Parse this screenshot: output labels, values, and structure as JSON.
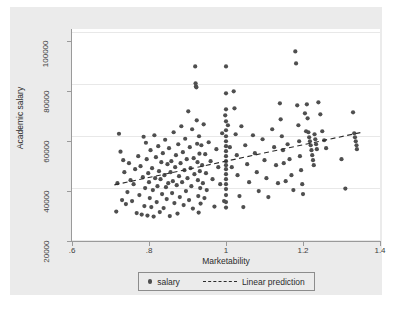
{
  "figure": {
    "background_color": "#ebebeb",
    "plot_background_color": "#ffffff",
    "marker_color": "#4f4f4f",
    "axis_color": "#9a9a9a",
    "grid_color": "#e8e8e8"
  },
  "legend": {
    "salary_label": "salary",
    "linear_prediction_label": "Linear prediction"
  },
  "chart_data": {
    "type": "scatter",
    "title": "",
    "xlabel": "Marketability",
    "ylabel": "Academic salary",
    "xlim": [
      0.6,
      1.4
    ],
    "ylim": [
      20000,
      105000
    ],
    "xticks": [
      0.6,
      0.8,
      1,
      1.2,
      1.4
    ],
    "xtick_labels": [
      ".6",
      ".8",
      "1",
      "1.2",
      "1.4"
    ],
    "yticks": [
      20000,
      40000,
      60000,
      80000,
      100000
    ],
    "ytick_labels": [
      "20000",
      "40000",
      "60000",
      "80000",
      "100000"
    ],
    "grid": "horizontal",
    "legend_position": "below-axis-centered",
    "series": [
      {
        "name": "salary",
        "type": "scatter",
        "marker": "circle",
        "color": "#4f4f4f",
        "points": [
          [
            0.715,
            31800
          ],
          [
            0.718,
            43200
          ],
          [
            0.722,
            63000
          ],
          [
            0.726,
            55800
          ],
          [
            0.73,
            36400
          ],
          [
            0.733,
            52400
          ],
          [
            0.736,
            47600
          ],
          [
            0.74,
            34800
          ],
          [
            0.744,
            39600
          ],
          [
            0.748,
            51200
          ],
          [
            0.752,
            44400
          ],
          [
            0.756,
            36000
          ],
          [
            0.76,
            42800
          ],
          [
            0.764,
            48800
          ],
          [
            0.768,
            31200
          ],
          [
            0.772,
            54000
          ],
          [
            0.775,
            38400
          ],
          [
            0.778,
            50000
          ],
          [
            0.781,
            30600
          ],
          [
            0.784,
            45600
          ],
          [
            0.786,
            61800
          ],
          [
            0.788,
            34000
          ],
          [
            0.79,
            41200
          ],
          [
            0.792,
            59400
          ],
          [
            0.794,
            52800
          ],
          [
            0.796,
            30200
          ],
          [
            0.798,
            47200
          ],
          [
            0.8,
            43600
          ],
          [
            0.802,
            37200
          ],
          [
            0.804,
            56400
          ],
          [
            0.806,
            33600
          ],
          [
            0.808,
            49200
          ],
          [
            0.81,
            40400
          ],
          [
            0.812,
            29800
          ],
          [
            0.814,
            62400
          ],
          [
            0.816,
            45200
          ],
          [
            0.818,
            53600
          ],
          [
            0.82,
            35600
          ],
          [
            0.822,
            42000
          ],
          [
            0.824,
            58000
          ],
          [
            0.826,
            48000
          ],
          [
            0.828,
            31600
          ],
          [
            0.83,
            44800
          ],
          [
            0.832,
            51600
          ],
          [
            0.834,
            38800
          ],
          [
            0.836,
            55200
          ],
          [
            0.838,
            33200
          ],
          [
            0.84,
            46400
          ],
          [
            0.842,
            60600
          ],
          [
            0.844,
            41600
          ],
          [
            0.846,
            36800
          ],
          [
            0.848,
            50800
          ],
          [
            0.85,
            43200
          ],
          [
            0.852,
            57200
          ],
          [
            0.854,
            30000
          ],
          [
            0.856,
            47600
          ],
          [
            0.858,
            52000
          ],
          [
            0.86,
            39200
          ],
          [
            0.862,
            44000
          ],
          [
            0.864,
            63600
          ],
          [
            0.866,
            35200
          ],
          [
            0.868,
            49600
          ],
          [
            0.87,
            54400
          ],
          [
            0.872,
            42400
          ],
          [
            0.874,
            31000
          ],
          [
            0.876,
            58800
          ],
          [
            0.878,
            46000
          ],
          [
            0.88,
            37600
          ],
          [
            0.882,
            51200
          ],
          [
            0.884,
            66000
          ],
          [
            0.886,
            43600
          ],
          [
            0.888,
            55600
          ],
          [
            0.89,
            34400
          ],
          [
            0.892,
            48400
          ],
          [
            0.894,
            61000
          ],
          [
            0.896,
            40000
          ],
          [
            0.898,
            52800
          ],
          [
            0.9,
            45200
          ],
          [
            0.902,
            72000
          ],
          [
            0.904,
            36400
          ],
          [
            0.906,
            57600
          ],
          [
            0.908,
            49200
          ],
          [
            0.91,
            42000
          ],
          [
            0.912,
            64800
          ],
          [
            0.914,
            33000
          ],
          [
            0.916,
            53200
          ],
          [
            0.918,
            46800
          ],
          [
            0.92,
            90000
          ],
          [
            0.921,
            83200
          ],
          [
            0.922,
            82000
          ],
          [
            0.923,
            81600
          ],
          [
            0.924,
            68400
          ],
          [
            0.925,
            59000
          ],
          [
            0.926,
            51600
          ],
          [
            0.927,
            44400
          ],
          [
            0.928,
            38000
          ],
          [
            0.929,
            31400
          ],
          [
            0.93,
            62000
          ],
          [
            0.931,
            55000
          ],
          [
            0.932,
            48000
          ],
          [
            0.933,
            41200
          ],
          [
            0.934,
            35000
          ],
          [
            0.936,
            58400
          ],
          [
            0.938,
            50400
          ],
          [
            0.94,
            43200
          ],
          [
            0.942,
            66800
          ],
          [
            0.944,
            37200
          ],
          [
            0.946,
            54800
          ],
          [
            0.948,
            47200
          ],
          [
            0.95,
            40400
          ],
          [
            0.955,
            59600
          ],
          [
            0.96,
            52000
          ],
          [
            0.965,
            44800
          ],
          [
            0.97,
            33800
          ],
          [
            0.975,
            56800
          ],
          [
            0.98,
            49600
          ],
          [
            0.985,
            42800
          ],
          [
            0.99,
            63200
          ],
          [
            0.995,
            36000
          ],
          [
            0.998,
            70400
          ],
          [
            1.0,
            90000
          ],
          [
            1.0,
            79200
          ],
          [
            1.0,
            72800
          ],
          [
            1.0,
            68000
          ],
          [
            1.0,
            64400
          ],
          [
            1.0,
            62000
          ],
          [
            1.0,
            60000
          ],
          [
            1.0,
            58000
          ],
          [
            1.0,
            56000
          ],
          [
            1.0,
            54000
          ],
          [
            1.0,
            52000
          ],
          [
            1.0,
            50400
          ],
          [
            1.0,
            48800
          ],
          [
            1.0,
            46800
          ],
          [
            1.0,
            44800
          ],
          [
            1.0,
            42800
          ],
          [
            1.0,
            40800
          ],
          [
            1.0,
            38400
          ],
          [
            1.0,
            35600
          ],
          [
            1.0,
            33400
          ],
          [
            1.005,
            66400
          ],
          [
            1.01,
            57600
          ],
          [
            1.015,
            49600
          ],
          [
            1.02,
            80000
          ],
          [
            1.022,
            73200
          ],
          [
            1.025,
            62800
          ],
          [
            1.028,
            54400
          ],
          [
            1.03,
            46400
          ],
          [
            1.035,
            38000
          ],
          [
            1.04,
            66000
          ],
          [
            1.045,
            33600
          ],
          [
            1.05,
            58400
          ],
          [
            1.055,
            50800
          ],
          [
            1.06,
            43600
          ],
          [
            1.07,
            62400
          ],
          [
            1.075,
            55200
          ],
          [
            1.08,
            47600
          ],
          [
            1.085,
            40000
          ],
          [
            1.095,
            60800
          ],
          [
            1.1,
            52400
          ],
          [
            1.105,
            45200
          ],
          [
            1.11,
            37600
          ],
          [
            1.12,
            64800
          ],
          [
            1.125,
            57600
          ],
          [
            1.13,
            50400
          ],
          [
            1.135,
            43200
          ],
          [
            1.14,
            75200
          ],
          [
            1.142,
            68800
          ],
          [
            1.145,
            62000
          ],
          [
            1.148,
            56400
          ],
          [
            1.15,
            51200
          ],
          [
            1.155,
            44000
          ],
          [
            1.16,
            58800
          ],
          [
            1.165,
            52800
          ],
          [
            1.17,
            46400
          ],
          [
            1.175,
            40400
          ],
          [
            1.18,
            96000
          ],
          [
            1.182,
            91200
          ],
          [
            1.185,
            74400
          ],
          [
            1.188,
            66400
          ],
          [
            1.19,
            60000
          ],
          [
            1.192,
            54000
          ],
          [
            1.195,
            48400
          ],
          [
            1.198,
            42800
          ],
          [
            1.2,
            38800
          ],
          [
            1.205,
            71200
          ],
          [
            1.208,
            64000
          ],
          [
            1.21,
            74800
          ],
          [
            1.212,
            69200
          ],
          [
            1.214,
            63600
          ],
          [
            1.216,
            61600
          ],
          [
            1.218,
            60000
          ],
          [
            1.22,
            58400
          ],
          [
            1.222,
            56400
          ],
          [
            1.224,
            54400
          ],
          [
            1.226,
            52400
          ],
          [
            1.228,
            50400
          ],
          [
            1.23,
            62800
          ],
          [
            1.232,
            60800
          ],
          [
            1.234,
            58800
          ],
          [
            1.236,
            56800
          ],
          [
            1.24,
            75600
          ],
          [
            1.245,
            70800
          ],
          [
            1.25,
            64000
          ],
          [
            1.255,
            60400
          ],
          [
            1.26,
            57200
          ],
          [
            1.3,
            52800
          ],
          [
            1.31,
            41000
          ],
          [
            1.33,
            71600
          ],
          [
            1.333,
            63200
          ],
          [
            1.335,
            61600
          ],
          [
            1.337,
            60000
          ],
          [
            1.339,
            58400
          ],
          [
            1.34,
            56800
          ]
        ]
      },
      {
        "name": "Linear prediction",
        "type": "line",
        "style": "dashed",
        "color": "#2b2b2b",
        "x_start": 0.71,
        "y_start": 42500,
        "x_end": 1.35,
        "y_end": 63500
      }
    ]
  }
}
